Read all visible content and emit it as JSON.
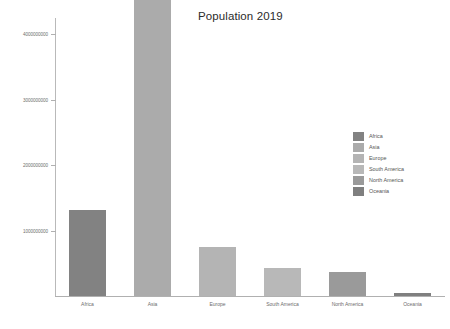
{
  "chart_data": {
    "type": "bar",
    "title": "Population 2019",
    "xlabel": "",
    "ylabel": "",
    "categories": [
      "Africa",
      "Asia",
      "Europe",
      "South America",
      "North America",
      "Oceania"
    ],
    "values": [
      1308064195,
      4601371198,
      747636026,
      430759766,
      366600964,
      42128035
    ],
    "series": [
      {
        "name": "Population 2019",
        "values": [
          1308064195,
          4601371198,
          747636026,
          430759766,
          366600964,
          42128035
        ]
      }
    ],
    "ylim": [
      0,
      4250000000
    ],
    "yticks": [
      1000000000,
      2000000000,
      3000000000,
      4000000000
    ],
    "ytick_labels": [
      "1000000000",
      "2000000000",
      "3000000000",
      "4000000000"
    ],
    "grid": false,
    "legend_position": "center-right",
    "legend_entries": [
      {
        "label": "Africa",
        "color": "#828282"
      },
      {
        "label": "Asia",
        "color": "#ababab"
      },
      {
        "label": "Europe",
        "color": "#b4b4b4"
      },
      {
        "label": "South America",
        "color": "#b8b8b8"
      },
      {
        "label": "North America",
        "color": "#9a9a9a"
      },
      {
        "label": "Oceania",
        "color": "#7f7f7f"
      }
    ],
    "bar_colors": [
      "#828282",
      "#ababab",
      "#b4b4b4",
      "#b8b8b8",
      "#9a9a9a",
      "#7f7f7f"
    ],
    "background_color": "#ffffff",
    "axis_color": "#b0b0b0",
    "text_color": "#6d6d6d"
  }
}
